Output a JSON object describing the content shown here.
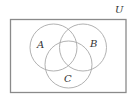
{
  "diagram": {
    "type": "venn",
    "universe": {
      "label": "U",
      "label_pos": [
        115,
        13
      ],
      "rect": {
        "x": 10.5,
        "y": 19.5,
        "width": 115.5,
        "height": 73
      }
    },
    "sets": [
      {
        "label": "A",
        "cx": 53.5,
        "cy": 47.5,
        "r": 23.5,
        "label_pos": [
          37,
          48
        ]
      },
      {
        "label": "B",
        "cx": 83,
        "cy": 47.5,
        "r": 23.5,
        "label_pos": [
          90,
          47
        ]
      },
      {
        "label": "C",
        "cx": 68.5,
        "cy": 64.5,
        "r": 23.5,
        "label_pos": [
          64,
          82
        ]
      }
    ],
    "colors": {
      "border": "#8a8a8a",
      "circle": "#a8a8a8",
      "text": "#333333"
    }
  }
}
